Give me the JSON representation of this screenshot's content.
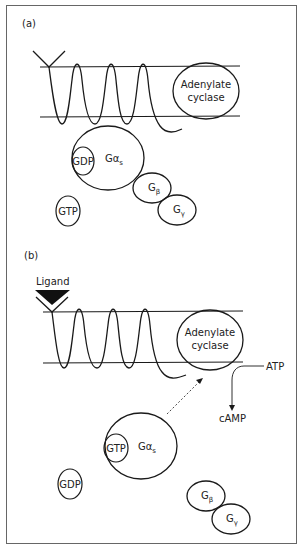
{
  "figure": {
    "panels": [
      {
        "id": "a",
        "label": "(a)",
        "receptor_tip": "Y-shaped extracellular receptor domain",
        "enzyme_label_line1": "Adenylate",
        "enzyme_label_line2": "cyclase",
        "g_alpha": {
          "base": "Gα",
          "sub": "s",
          "bound": "GDP"
        },
        "free_nucleotide": "GTP",
        "g_beta": {
          "base": "G",
          "sub": "β"
        },
        "g_gamma": {
          "base": "G",
          "sub": "γ"
        }
      },
      {
        "id": "b",
        "label": "(b)",
        "ligand": "Ligand",
        "enzyme_label_line1": "Adenylate",
        "enzyme_label_line2": "cyclase",
        "substrate": "ATP",
        "product": "cAMP",
        "g_alpha": {
          "base": "Gα",
          "sub": "s",
          "bound": "GTP"
        },
        "free_nucleotide": "GDP",
        "g_beta": {
          "base": "G",
          "sub": "β"
        },
        "g_gamma": {
          "base": "G",
          "sub": "γ"
        }
      }
    ],
    "colors": {
      "stroke": "#1a1a1a",
      "frame": "#666666",
      "background": "#ffffff"
    }
  }
}
